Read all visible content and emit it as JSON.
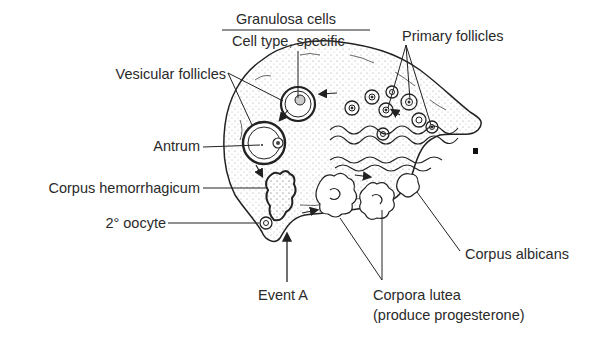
{
  "diagram": {
    "header": {
      "top_label": "Granulosa cells",
      "bottom_label": "Cell type, specific"
    },
    "labels": {
      "primary_follicles": "Primary follicles",
      "vesicular_follicles": "Vesicular follicles",
      "antrum": "Antrum",
      "corpus_hemorrhagicum": "Corpus hemorrhagicum",
      "secondary_oocyte": "2° oocyte",
      "event_a": "Event A",
      "corpora_lutea": "Corpora lutea",
      "corpora_lutea_note": "(produce progesterone)",
      "corpus_albicans": "Corpus albicans"
    },
    "colors": {
      "ink": "#2a2a2a",
      "background": "#ffffff",
      "stipple": "#9a9a9a"
    }
  }
}
